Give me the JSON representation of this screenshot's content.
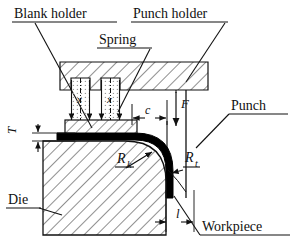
{
  "diagram": {
    "labels": {
      "blank_holder": "Blank holder",
      "punch_holder": "Punch holder",
      "spring": "Spring",
      "punch": "Punch",
      "die": "Die",
      "workpiece": "Workpiece"
    },
    "symbols": {
      "force": "F",
      "clearance": "c",
      "thickness": "T",
      "die_radius": "R",
      "die_radius_sub": "k",
      "punch_radius": "R",
      "punch_radius_sub": "t",
      "draw_depth": "l",
      "spring_travel_1": "x",
      "spring_travel_2": "x"
    },
    "colors": {
      "line": "#111111",
      "hatch": "#333333",
      "sheet": "#000000",
      "background": "#ffffff",
      "dotted_fill": "#9a9a9a"
    }
  }
}
